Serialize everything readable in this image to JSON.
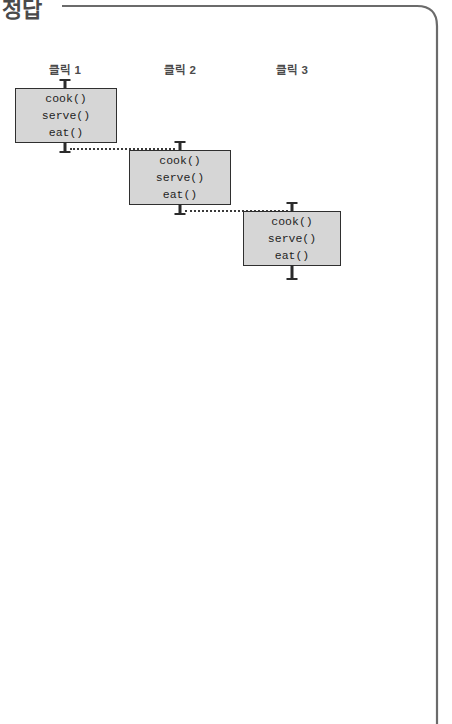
{
  "header": {
    "title": "정답",
    "rule_color": "#555555"
  },
  "frame": {
    "border_color": "#6b6b6b",
    "corner_radius": 22
  },
  "diagram": {
    "type": "sequence-staircase",
    "box_fill": "#d6d6d6",
    "box_border": "#2f2f2f",
    "connector_style": "dotted",
    "connector_color": "#3a3a3a",
    "columns": [
      {
        "label": "클릭 1"
      },
      {
        "label": "클릭 2"
      },
      {
        "label": "클릭 3"
      }
    ],
    "calls": [
      "cook()",
      "serve()",
      "eat()"
    ],
    "steps": [
      {
        "label": "클릭 1",
        "lines": [
          "cook()",
          "serve()",
          "eat()"
        ],
        "x": 15,
        "y": 88,
        "w": 102,
        "h": 55,
        "tick_x": 65
      },
      {
        "label": "클릭 2",
        "lines": [
          "cook()",
          "serve()",
          "eat()"
        ],
        "x": 129,
        "y": 150,
        "w": 102,
        "h": 55,
        "tick_x": 180
      },
      {
        "label": "클릭 3",
        "lines": [
          "cook()",
          "serve()",
          "eat()"
        ],
        "x": 243,
        "y": 211,
        "w": 98,
        "h": 55,
        "tick_x": 292
      }
    ],
    "links": [
      {
        "from": "step-1",
        "to": "step-2",
        "x1": 65,
        "x2": 180,
        "y": 147
      },
      {
        "from": "step-2",
        "to": "step-3",
        "x1": 180,
        "x2": 292,
        "y": 209
      }
    ]
  }
}
